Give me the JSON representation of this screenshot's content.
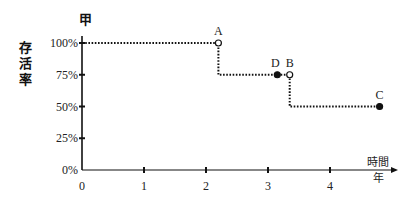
{
  "chart_data": {
    "type": "line",
    "title": "甲",
    "ylabel": "存活率",
    "xlabel": "時間 年",
    "x_label_top": "時間",
    "x_label_bottom": "年",
    "xticks": [
      "0",
      "1",
      "2",
      "3",
      "4"
    ],
    "yticks": [
      "0%",
      "25%",
      "50%",
      "75%",
      "100%"
    ],
    "xlim": [
      0,
      5
    ],
    "ylim": [
      0,
      100
    ],
    "grid": false,
    "style": "step, dotted",
    "series": [
      {
        "name": "survival",
        "x": [
          0,
          2.2,
          2.2,
          3.35,
          3.35,
          4.8
        ],
        "y": [
          100,
          100,
          75,
          75,
          50,
          50
        ]
      }
    ],
    "points": [
      {
        "label": "A",
        "x": 2.2,
        "y": 100,
        "marker": "open"
      },
      {
        "label": "D",
        "x": 3.15,
        "y": 75,
        "marker": "filled"
      },
      {
        "label": "B",
        "x": 3.35,
        "y": 75,
        "marker": "open"
      },
      {
        "label": "C",
        "x": 4.8,
        "y": 50,
        "marker": "filled"
      }
    ]
  }
}
